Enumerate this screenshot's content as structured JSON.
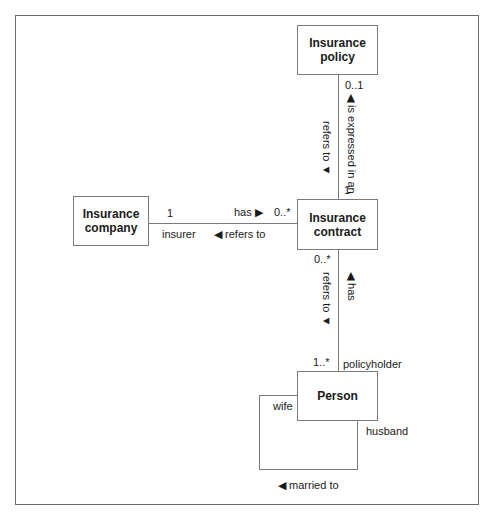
{
  "diagram": {
    "type": "UML class diagram",
    "classes": {
      "policy": "Insurance policy",
      "company": "Insurance company",
      "contract": "Insurance contract",
      "person": "Person"
    },
    "associations": {
      "policy_contract": {
        "policy_mult": "0..1",
        "contract_mult": "1",
        "label_right": "◀ is expressed in an",
        "label_left": "refers to ▼"
      },
      "company_contract": {
        "company_mult": "1",
        "company_role": "insurer",
        "contract_mult": "0..*",
        "label_top": "has ▶",
        "label_bottom": "◀ refers to"
      },
      "contract_person": {
        "contract_mult": "0..*",
        "person_mult": "1..*",
        "person_role": "policyholder",
        "label_left": "refers to ▼",
        "label_right": "◀ has"
      },
      "person_self": {
        "role_wife": "wife",
        "role_husband": "husband",
        "label": "◀ married to"
      }
    }
  }
}
